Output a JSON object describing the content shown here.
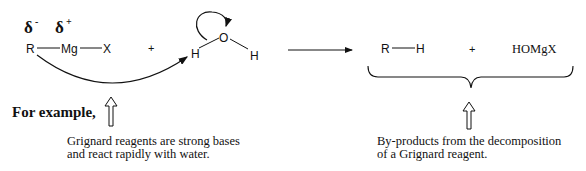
{
  "reactant1": {
    "delta_minus": "δ",
    "delta_minus_sup": "-",
    "delta_plus": "δ",
    "delta_plus_sup": "+",
    "atom_r": "R",
    "atom_mg": "Mg",
    "atom_x": "X"
  },
  "plus1": "+",
  "water": {
    "h_left": "H",
    "o": "O",
    "h_right": "H"
  },
  "products": {
    "rh_r": "R",
    "rh_h": "H",
    "plus": "+",
    "homgx": "HOMgX"
  },
  "example_label": "For example,",
  "caption_left": {
    "line1": "Grignard reagents are strong bases",
    "line2": "and react rapidly with water."
  },
  "caption_right": {
    "line1": "By-products from the decomposition",
    "line2": "of a Grignard reagent."
  },
  "colors": {
    "ink": "#111111",
    "background": "#ffffff"
  }
}
